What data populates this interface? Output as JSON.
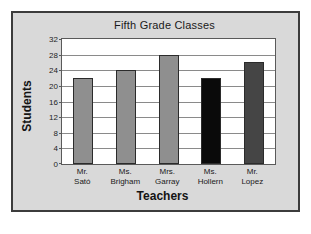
{
  "chart_data": {
    "type": "bar",
    "title": "Fifth Grade Classes",
    "xlabel": "Teachers",
    "ylabel": "Students",
    "categories": [
      "Mr. Sató",
      "Ms. Brigham",
      "Mrs. Garray",
      "Ms. Hollern",
      "Mr. Lopez"
    ],
    "category_lines": [
      {
        "line1": "Mr.",
        "line2": "Sató"
      },
      {
        "line1": "Ms.",
        "line2": "Brigham"
      },
      {
        "line1": "Mrs.",
        "line2": "Garray"
      },
      {
        "line1": "Ms.",
        "line2": "Hollern"
      },
      {
        "line1": "Mr.",
        "line2": "Lopez"
      }
    ],
    "values": [
      22,
      24,
      28,
      22,
      26
    ],
    "bar_colors": [
      "#8f8f8f",
      "#8f8f8f",
      "#8f8f8f",
      "#0a0a0a",
      "#454545"
    ],
    "ylim": [
      0,
      32
    ],
    "ytick_labels": [
      "0",
      "4",
      "8",
      "12",
      "16",
      "20",
      "24",
      "28",
      "32"
    ],
    "ytick_values": [
      0,
      4,
      8,
      12,
      16,
      20,
      24,
      28,
      32
    ],
    "grid": true,
    "legend": "none"
  },
  "figure": {
    "background_color": "#d9d9d9",
    "plot_background_color": "#ffffff",
    "border_color": "#3c3c3c",
    "gridline_color": "#8a8a8a"
  }
}
